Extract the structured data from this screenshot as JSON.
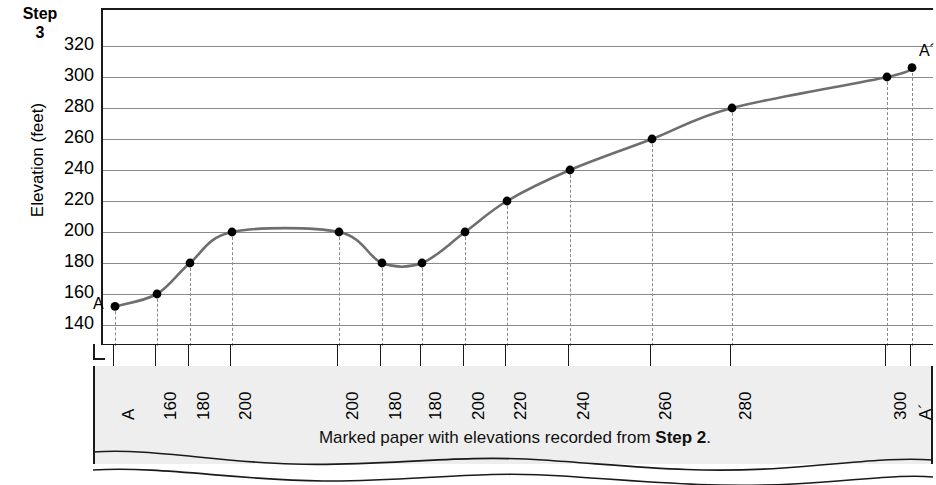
{
  "step": {
    "word": "Step",
    "number": "3"
  },
  "axes": {
    "ylabel": "Elevation (feet)",
    "yticks": [
      "320",
      "300",
      "280",
      "260",
      "240",
      "220",
      "200",
      "180",
      "160",
      "140"
    ],
    "ymin": 130,
    "ymax": 330,
    "xticklabels": [
      "A",
      "160",
      "180",
      "200",
      "200",
      "180",
      "180",
      "200",
      "220",
      "240",
      "260",
      "280",
      "300",
      "A´"
    ]
  },
  "endpoint_labels": {
    "left": "A",
    "right": "A´"
  },
  "caption": {
    "text_before": "Marked paper with elevations recorded from ",
    "bold": "Step 2",
    "text_after": "."
  },
  "colors": {
    "profile_line": "#6e6e6e",
    "point": "#000000",
    "gridline": "#8a8a8a",
    "dashed": "#8a8a8a",
    "axis": "#1a1a1a",
    "paper": "#eeeeee"
  },
  "chart_data": {
    "type": "line",
    "xlabel": "",
    "ylabel": "Elevation (feet)",
    "ylim": [
      130,
      330
    ],
    "grid": true,
    "legend": "none",
    "categories": [
      "A",
      "160",
      "180",
      "200",
      "200",
      "180",
      "180",
      "200",
      "220",
      "240",
      "260",
      "280",
      "300",
      "A´"
    ],
    "x": [
      113,
      155,
      188,
      230,
      337,
      380,
      420,
      463,
      505,
      568,
      650,
      730,
      885,
      910
    ],
    "values": [
      152,
      160,
      180,
      200,
      200,
      180,
      180,
      200,
      220,
      240,
      260,
      280,
      300,
      306
    ],
    "smoothing": "spline",
    "annotations": [
      {
        "label": "A",
        "x": 113,
        "y": 152
      },
      {
        "label": "A´",
        "x": 910,
        "y": 306
      }
    ]
  }
}
